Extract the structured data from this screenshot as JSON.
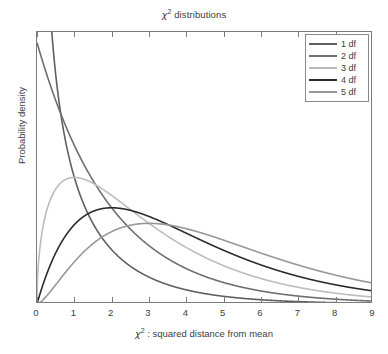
{
  "chart_data": {
    "type": "line",
    "title_parts": {
      "symbol": "χ",
      "exponent": "2",
      "rest": " distributions"
    },
    "xlabel": "χ² : squared distance from mean",
    "xlabel_parts": {
      "symbol": "χ",
      "exponent": "2",
      "rest": " : squared distance from mean"
    },
    "ylabel": "Probability density",
    "xlim": [
      0,
      9
    ],
    "ylim": [
      0,
      0.52
    ],
    "xticks": [
      0,
      1,
      2,
      3,
      4,
      5,
      6,
      7,
      8,
      9
    ],
    "xtick_labels": [
      "0",
      "1",
      "2",
      "3",
      "4",
      "5",
      "6",
      "7",
      "8",
      "9"
    ],
    "yticks": [],
    "ytick_labels": [],
    "grid": false,
    "legend_position": "top-right",
    "x": [
      0.02,
      0.05,
      0.1,
      0.15,
      0.2,
      0.3,
      0.4,
      0.5,
      0.6,
      0.8,
      1.0,
      1.25,
      1.5,
      1.75,
      2.0,
      2.25,
      2.5,
      2.75,
      3.0,
      3.5,
      4.0,
      4.5,
      5.0,
      5.5,
      6.0,
      6.5,
      7.0,
      7.5,
      8.0,
      8.5,
      9.0
    ],
    "series": [
      {
        "name": "1 df",
        "df": 1,
        "color": "#5f5f5f",
        "values": [
          2.7945,
          1.74,
          1.2,
          0.9575,
          0.8071,
          0.6253,
          0.5158,
          0.4394,
          0.3818,
          0.2997,
          0.242,
          0.1887,
          0.1506,
          0.1219,
          0.1038,
          0.086,
          0.0721,
          0.0609,
          0.0513,
          0.0376,
          0.027,
          0.0193,
          0.0146,
          0.0107,
          0.0081,
          0.0061,
          0.0046,
          0.0035,
          0.0027,
          0.002,
          0.0016
        ]
      },
      {
        "name": "2 df",
        "df": 2,
        "color": "#6e6e6e",
        "values": [
          0.495,
          0.4877,
          0.4756,
          0.4638,
          0.4524,
          0.4304,
          0.4094,
          0.3894,
          0.3704,
          0.3352,
          0.3033,
          0.2677,
          0.2363,
          0.2086,
          0.1839,
          0.1624,
          0.1433,
          0.1265,
          0.1116,
          0.0869,
          0.0677,
          0.0527,
          0.041,
          0.0319,
          0.0249,
          0.0194,
          0.0151,
          0.0118,
          0.0092,
          0.0071,
          0.0056
        ]
      },
      {
        "name": "3 df",
        "df": 3,
        "color": "#bcbcbc",
        "values": [
          0.0279,
          0.0437,
          0.0609,
          0.0736,
          0.0836,
          0.099,
          0.1098,
          0.1176,
          0.1231,
          0.1296,
          0.1295,
          0.1258,
          0.1194,
          0.1118,
          0.1037,
          0.0955,
          0.0873,
          0.0794,
          0.0719,
          0.0582,
          0.0467,
          0.0372,
          0.0295,
          0.0233,
          0.0184,
          0.0145,
          0.0114,
          0.009,
          0.0071,
          0.0055,
          0.0043
        ]
      },
      {
        "name": "4 df",
        "df": 4,
        "color": "#2b2b2b",
        "values": [
          0.0025,
          0.0061,
          0.0119,
          0.0174,
          0.0226,
          0.0323,
          0.0409,
          0.0487,
          0.0556,
          0.067,
          0.0758,
          0.0837,
          0.0886,
          0.0912,
          0.092,
          0.0913,
          0.0895,
          0.087,
          0.0837,
          0.076,
          0.0677,
          0.0595,
          0.0513,
          0.0439,
          0.0373,
          0.0315,
          0.0265,
          0.0221,
          0.0183,
          0.0152,
          0.0125
        ]
      },
      {
        "name": "5 df",
        "df": 5,
        "color": "#979797",
        "values": [
          0.0002,
          0.0007,
          0.0019,
          0.0035,
          0.0053,
          0.0093,
          0.0135,
          0.0178,
          0.0219,
          0.0295,
          0.0362,
          0.0432,
          0.0487,
          0.0527,
          0.0555,
          0.0572,
          0.058,
          0.058,
          0.0575,
          0.0551,
          0.0515,
          0.0473,
          0.0427,
          0.0382,
          0.0337,
          0.0296,
          0.0258,
          0.0223,
          0.0192,
          0.0165,
          0.014
        ]
      }
    ]
  },
  "legend": {
    "entries": [
      {
        "label": "1 df",
        "color": "#5f5f5f"
      },
      {
        "label": "2 df",
        "color": "#6e6e6e"
      },
      {
        "label": "3 df",
        "color": "#bcbcbc"
      },
      {
        "label": "4 df",
        "color": "#2b2b2b"
      },
      {
        "label": "5 df",
        "color": "#979797"
      }
    ]
  },
  "style": {
    "axis_color": "#7b7b7b",
    "text_color": "#3d3d3d",
    "background": "#ffffff"
  }
}
